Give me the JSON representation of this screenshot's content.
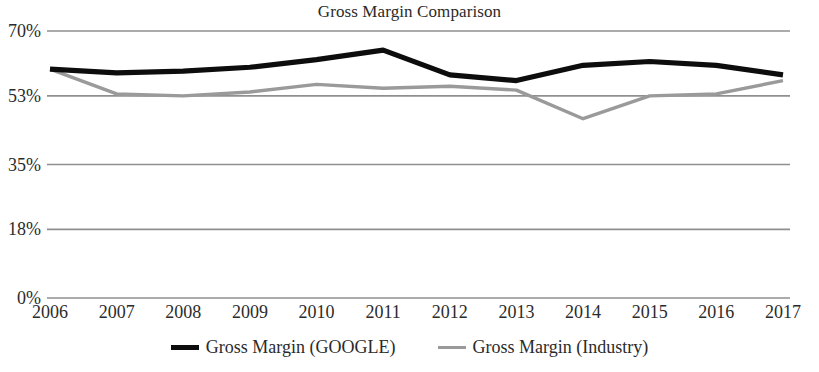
{
  "chart_data": {
    "type": "line",
    "title": "Gross Margin Comparison",
    "xlabel": "",
    "ylabel": "",
    "categories": [
      "2006",
      "2007",
      "2008",
      "2009",
      "2010",
      "2011",
      "2012",
      "2013",
      "2014",
      "2015",
      "2016",
      "2017"
    ],
    "y_ticks": [
      "0%",
      "18%",
      "35%",
      "53%",
      "70%"
    ],
    "y_tick_values": [
      0,
      18,
      35,
      53,
      70
    ],
    "ylim": [
      0,
      70
    ],
    "grid": "horizontal",
    "legend_position": "bottom",
    "series": [
      {
        "name": "Gross Margin (GOOGLE)",
        "color": "#0d0d0d",
        "values": [
          60.0,
          59.0,
          59.5,
          60.5,
          62.5,
          65.0,
          58.5,
          57.0,
          61.0,
          62.0,
          61.0,
          58.5
        ]
      },
      {
        "name": "Gross Margin (Industry)",
        "color": "#9a9a9a",
        "values": [
          60.0,
          53.5,
          53.0,
          54.0,
          56.0,
          55.0,
          55.5,
          54.5,
          47.0,
          53.0,
          53.5,
          57.0
        ]
      }
    ]
  },
  "legend": {
    "items": [
      {
        "label": "Gross Margin (GOOGLE)",
        "swatch": "google-line-swatch"
      },
      {
        "label": "Gross Margin (Industry)",
        "swatch": "industry-line-swatch"
      }
    ]
  },
  "colors": {
    "google_line": "#0d0d0d",
    "industry_line": "#9a9a9a",
    "gridline": "#8f8f8f",
    "text": "#2b2b2b",
    "background": "#ffffff"
  }
}
